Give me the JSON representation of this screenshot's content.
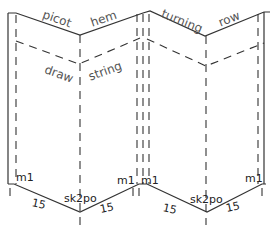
{
  "diagram": {
    "top_labels": [
      "picot",
      "hem",
      "turning",
      "row"
    ],
    "middle_labels": [
      "draw",
      "string"
    ],
    "bottom_left": {
      "m1_left": "m1",
      "count_left": "15",
      "center": "sk2po",
      "count_right": "15",
      "m1_right": "m1"
    },
    "bottom_right": {
      "m1_left": "m1",
      "count_left": "15",
      "center": "sk2po",
      "count_right": "15",
      "m1_right": "m1"
    },
    "line_color": "#333333",
    "label_color": "#555555"
  }
}
